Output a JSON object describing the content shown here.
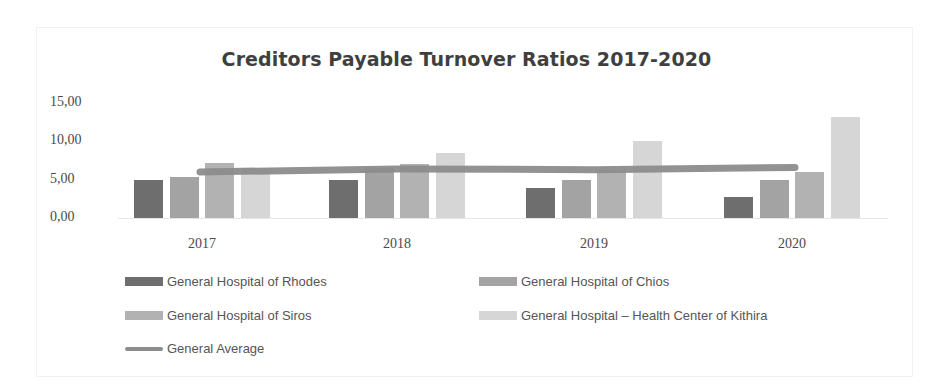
{
  "chart_data": {
    "type": "bar",
    "title": "Creditors Payable Turnover Ratios 2017-2020",
    "xlabel": "",
    "ylabel": "",
    "ylim": [
      0,
      15
    ],
    "yticks": [
      "0,00",
      "5,00",
      "10,00",
      "15,00"
    ],
    "categories": [
      "2017",
      "2018",
      "2019",
      "2020"
    ],
    "series": [
      {
        "name": "General Hospital of Rhodes",
        "kind": "bar",
        "color": "#6e6e6e",
        "values": [
          5.0,
          5.0,
          3.9,
          2.8
        ]
      },
      {
        "name": "General Hospital of Chios",
        "kind": "bar",
        "color": "#a3a3a3",
        "values": [
          5.3,
          6.5,
          5.0,
          5.0
        ]
      },
      {
        "name": "General Hospital of Siros",
        "kind": "bar",
        "color": "#b2b2b2",
        "values": [
          7.2,
          7.0,
          6.2,
          6.0
        ]
      },
      {
        "name": "General Hospital – Health Center of Kithira",
        "kind": "bar",
        "color": "#d6d6d6",
        "values": [
          6.5,
          8.5,
          10.0,
          13.2
        ]
      },
      {
        "name": "General Average",
        "kind": "line",
        "color": "#8c8c8c",
        "values": [
          6.0,
          6.4,
          6.3,
          6.6
        ]
      }
    ],
    "grid": false,
    "legend_position": "bottom"
  },
  "legend": [
    "General Hospital of Rhodes",
    "General Hospital of Chios",
    "General Hospital of Siros",
    "General Hospital – Health Center of Kithira",
    "General Average"
  ]
}
